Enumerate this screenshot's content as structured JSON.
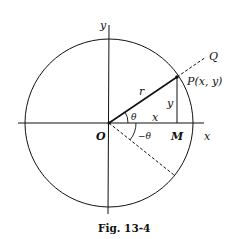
{
  "figure": {
    "caption": "Fig. 13-4",
    "labels": {
      "y_axis": "y",
      "x_axis": "x",
      "origin": "O",
      "point_p": "P(x, y)",
      "point_q": "Q",
      "point_m": "M",
      "radius": "r",
      "leg_y": "y",
      "leg_x": "x",
      "angle_pos": "θ",
      "angle_neg": "−θ"
    },
    "colors": {
      "line": "#111111",
      "background": "#ffffff"
    }
  }
}
